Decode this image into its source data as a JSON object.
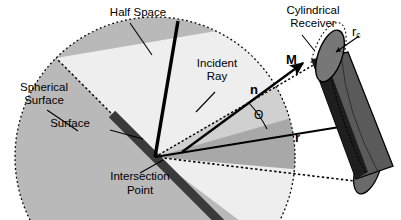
{
  "figure": {
    "width": 401,
    "height": 220,
    "background": "#ffffff"
  },
  "colors": {
    "background": "#ffffff",
    "sphere_fill": "#b9b9b9",
    "half_space_fill": "#eeeeee",
    "cone_fill": "#a8a8a8",
    "cone_fill_light": "#d8d8d8",
    "surface_bar": "#3a3a3a",
    "cylinder_body": "#5a5a5a",
    "cylinder_dark_edge": "#1c1c1c",
    "cylinder_cap": "#707070",
    "line": "#000000"
  },
  "labels": {
    "half_space": "Half Space",
    "spherical_surface_line1": "Spherical",
    "spherical_surface_line2": "Surface",
    "incident_ray_line1": "Incident",
    "incident_ray_line2": "Ray",
    "surface": "Surface",
    "intersection_point_line1": "Intersection",
    "intersection_point_line2": "Point",
    "cylindrical_receiver_line1": "Cylindrical",
    "cylindrical_receiver_line2": "Receiver",
    "radius_symbol": "r",
    "radius_subscript": "c",
    "vector_m": "M",
    "vector_n": "n",
    "vector_r": "r",
    "angle_theta": "Θ"
  },
  "geometry": {
    "intersection_point": {
      "x": 155,
      "y": 157
    },
    "sphere_center": {
      "x": 155,
      "y": 157
    },
    "sphere_radius": 140,
    "cylinder_axis_top": {
      "x": 330,
      "y": 52
    },
    "cylinder_axis_bottom": {
      "x": 368,
      "y": 168
    },
    "cylinder_radius_px": 27
  }
}
